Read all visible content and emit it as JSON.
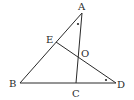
{
  "diagram": {
    "points": {
      "A": {
        "label": "A",
        "x": 82,
        "y": 13
      },
      "B": {
        "label": "B",
        "x": 20,
        "y": 83
      },
      "C": {
        "label": "C",
        "x": 76,
        "y": 83
      },
      "D": {
        "label": "D",
        "x": 116,
        "y": 83
      },
      "E": {
        "label": "E",
        "x": 56,
        "y": 42
      },
      "O": {
        "label": "O",
        "x": 78,
        "y": 57
      }
    },
    "segments": [
      {
        "name": "AB",
        "from": "A",
        "to": "B"
      },
      {
        "name": "AC",
        "from": "A",
        "to": "C"
      },
      {
        "name": "BD",
        "from": "B",
        "to": "D"
      },
      {
        "name": "ED",
        "from": "E",
        "to": "D"
      }
    ],
    "angle_marks": [
      {
        "name": "angle-BAC",
        "vertex": "A",
        "x": 78,
        "y": 24
      },
      {
        "name": "angle-EDB",
        "vertex": "D",
        "x": 106,
        "y": 80
      }
    ],
    "labels": {
      "A": "A",
      "B": "B",
      "C": "C",
      "D": "D",
      "E": "E",
      "O": "O"
    }
  }
}
